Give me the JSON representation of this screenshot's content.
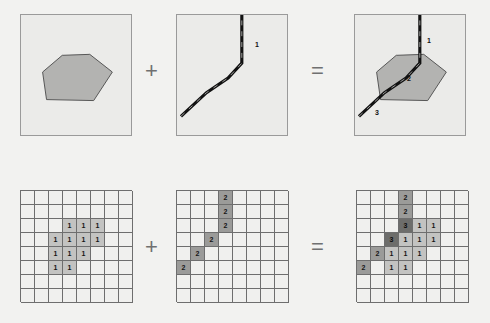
{
  "figure": {
    "type": "diagram",
    "operators": {
      "plus": "+",
      "equals": "="
    },
    "colors": {
      "panel_background": "#ebebe9",
      "panel_border": "#9a9a9a",
      "polygon_fill": "#b3b3b1",
      "polygon_stroke": "#555555",
      "line_stroke": "#111111",
      "grid_line": "#6e6e6e",
      "cell_empty": "#f0f0ee",
      "cell_value_1": "#c3c3c1",
      "cell_value_2": "#9b9b99",
      "cell_value_3": "#6d6d6b"
    }
  },
  "top_row": {
    "panel_a": {
      "name": "polygon-layer",
      "labels": []
    },
    "panel_b": {
      "name": "line-layer",
      "labels": [
        {
          "text": "1",
          "x": 78,
          "y": 28
        }
      ]
    },
    "panel_c": {
      "name": "overlay-result",
      "labels": [
        {
          "text": "1",
          "x": 78,
          "y": 26
        },
        {
          "text": "2",
          "x": 57,
          "y": 64
        },
        {
          "text": "3",
          "x": 24,
          "y": 97
        }
      ]
    }
  },
  "bottom_row": {
    "rows": 8,
    "cols": 8,
    "grid_a": {
      "name": "raster-polygon",
      "cells": [
        [
          "",
          "",
          "",
          "",
          "",
          "",
          "",
          ""
        ],
        [
          "",
          "",
          "",
          "",
          "",
          "",
          "",
          ""
        ],
        [
          "",
          "",
          "",
          "1",
          "1",
          "1",
          "",
          ""
        ],
        [
          "",
          "",
          "1",
          "1",
          "1",
          "1",
          "",
          ""
        ],
        [
          "",
          "",
          "1",
          "1",
          "1",
          "",
          "",
          ""
        ],
        [
          "",
          "",
          "1",
          "1",
          "",
          "",
          "",
          ""
        ],
        [
          "",
          "",
          "",
          "",
          "",
          "",
          "",
          ""
        ],
        [
          "",
          "",
          "",
          "",
          "",
          "",
          "",
          ""
        ]
      ]
    },
    "grid_b": {
      "name": "raster-line",
      "cells": [
        [
          "",
          "",
          "",
          "2",
          "",
          "",
          "",
          ""
        ],
        [
          "",
          "",
          "",
          "2",
          "",
          "",
          "",
          ""
        ],
        [
          "",
          "",
          "",
          "2",
          "",
          "",
          "",
          ""
        ],
        [
          "",
          "",
          "2",
          "",
          "",
          "",
          "",
          ""
        ],
        [
          "",
          "2",
          "",
          "",
          "",
          "",
          "",
          ""
        ],
        [
          "2",
          "",
          "",
          "",
          "",
          "",
          "",
          ""
        ],
        [
          "",
          "",
          "",
          "",
          "",
          "",
          "",
          ""
        ],
        [
          "",
          "",
          "",
          "",
          "",
          "",
          "",
          ""
        ]
      ]
    },
    "grid_c": {
      "name": "raster-result",
      "cells": [
        [
          "",
          "",
          "",
          "2",
          "",
          "",
          "",
          ""
        ],
        [
          "",
          "",
          "",
          "2",
          "",
          "",
          "",
          ""
        ],
        [
          "",
          "",
          "",
          "3",
          "1",
          "1",
          "",
          ""
        ],
        [
          "",
          "",
          "3",
          "1",
          "1",
          "1",
          "",
          ""
        ],
        [
          "",
          "2",
          "1",
          "1",
          "1",
          "",
          "",
          ""
        ],
        [
          "2",
          "",
          "1",
          "1",
          "",
          "",
          "",
          ""
        ],
        [
          "",
          "",
          "",
          "",
          "",
          "",
          "",
          ""
        ],
        [
          "",
          "",
          "",
          "",
          "",
          "",
          "",
          ""
        ]
      ]
    }
  }
}
